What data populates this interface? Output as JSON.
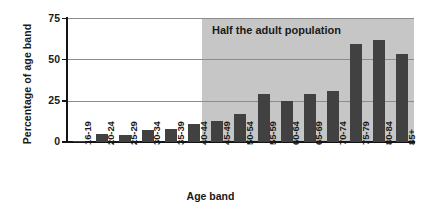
{
  "chart_data": {
    "type": "bar",
    "title": "",
    "xlabel": "Age band",
    "ylabel": "Percentage of age band",
    "categories": [
      "16-19",
      "20-24",
      "25-29",
      "30-34",
      "35-39",
      "40-44",
      "45-49",
      "50-54",
      "55-59",
      "60-64",
      "65-69",
      "70-74",
      "75-79",
      "80-84",
      "85+"
    ],
    "values": [
      0.5,
      5,
      4.5,
      7,
      8,
      11,
      13,
      17,
      29,
      25,
      29,
      31,
      59,
      62,
      53
    ],
    "ylim": [
      0,
      75
    ],
    "yticks": [
      0,
      25,
      50,
      75
    ],
    "ytick_labels": [
      "0",
      "25",
      "50",
      "75"
    ],
    "grid": true,
    "legend": "none",
    "series_color": "#414141",
    "annotations": [
      {
        "text": "Half the adult population",
        "start_category": "45-49",
        "end_category": "85+",
        "shade_color": "#c6c6c6"
      }
    ]
  }
}
